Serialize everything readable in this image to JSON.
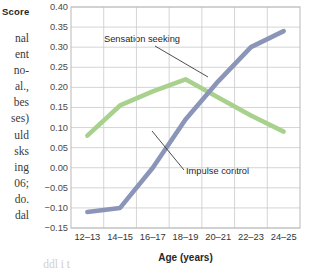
{
  "chart_data": {
    "type": "line",
    "title": "",
    "xlabel": "Age (years)",
    "ylabel": "Score",
    "categories": [
      "12–13",
      "14–15",
      "16–17",
      "18–19",
      "20–21",
      "22–23",
      "24–25"
    ],
    "ylim": [
      -0.15,
      0.4
    ],
    "yticks": [
      "0.40",
      "0.35",
      "0.30",
      "0.25",
      "0.20",
      "0.15",
      "0.10",
      "0.05",
      "0.00",
      "−0.05",
      "−0.10",
      "−0.15"
    ],
    "ytick_values": [
      0.4,
      0.35,
      0.3,
      0.25,
      0.2,
      0.15,
      0.1,
      0.05,
      0.0,
      -0.05,
      -0.1,
      -0.15
    ],
    "grid": true,
    "legend_position": "inline-annotations",
    "series": [
      {
        "name": "Sensation seeking",
        "color": "#a9d18e",
        "values": [
          0.08,
          0.155,
          0.19,
          0.22,
          0.175,
          0.13,
          0.09
        ]
      },
      {
        "name": "Impulse control",
        "color": "#8a95b8",
        "values": [
          -0.11,
          -0.1,
          0.0,
          0.12,
          0.215,
          0.3,
          0.34
        ]
      }
    ],
    "annotations": [
      {
        "label": "Sensation seeking",
        "target_series": "Sensation seeking",
        "target_x": "18–19"
      },
      {
        "label": "Impulse control",
        "target_series": "Impulse control",
        "target_x": "18–19"
      }
    ]
  },
  "margin_text": {
    "fragments": [
      "nal",
      "ent",
      "no-",
      "al.,",
      "bes",
      "ses)",
      "uld",
      "sks",
      "ing",
      "06;",
      "do.",
      "dal"
    ],
    "bottom_fragment": "ddl i t"
  }
}
